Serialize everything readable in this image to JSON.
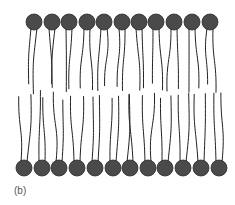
{
  "figure": {
    "caption": "(b)",
    "head_color": "#4a4a4a",
    "head_stroke": "#2a2a2a",
    "tail_color": "#222222",
    "top_leaflet": {
      "head_count": 11,
      "head_y": 22,
      "head_radius": 8,
      "head_x": [
        34,
        52,
        69,
        87,
        104,
        122,
        139,
        156,
        174,
        192,
        210
      ]
    },
    "bottom_leaflet": {
      "head_count": 12,
      "head_y": 168,
      "head_radius": 8,
      "head_x": [
        24,
        42,
        59,
        77,
        95,
        113,
        130,
        148,
        165,
        183,
        201,
        219
      ]
    }
  }
}
